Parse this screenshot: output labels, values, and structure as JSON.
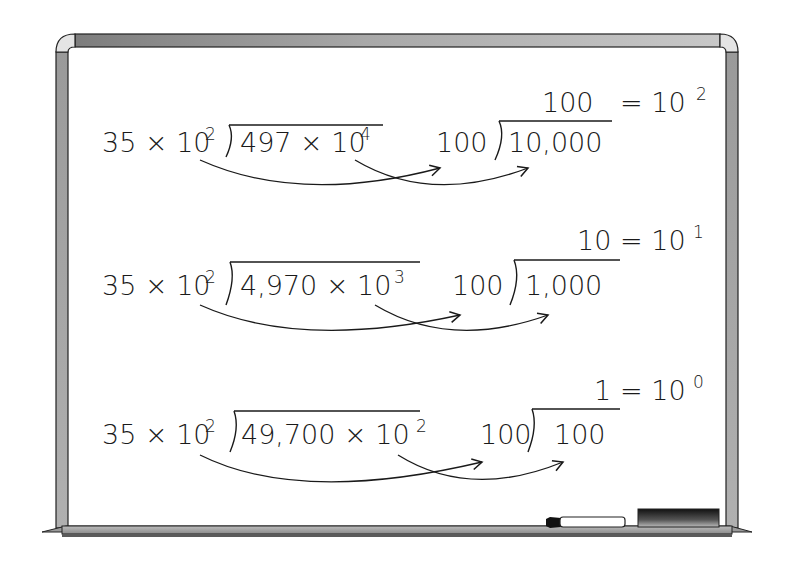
{
  "whiteboard": {
    "frame_color": "#9a9a9a",
    "frame_dark": "#3a3a3a",
    "ink_color": "#1a1a1a",
    "rows": [
      {
        "divisor": "35 × 10",
        "divisor_exp": "2",
        "dividend": "497 × 10",
        "dividend_exp": "4",
        "simplified_divisor": "100",
        "simplified_dividend": "10,000",
        "quotient": "100",
        "equals": "= 10",
        "quotient_exp": "2"
      },
      {
        "divisor": "35 × 10",
        "divisor_exp": "2",
        "dividend": "4,970 × 10",
        "dividend_exp": "3",
        "simplified_divisor": "100",
        "simplified_dividend": "1,000",
        "quotient": "10",
        "equals": "= 10",
        "quotient_exp": "1"
      },
      {
        "divisor": "35 × 10",
        "divisor_exp": "2",
        "dividend": "49,700 × 10",
        "dividend_exp": "2",
        "simplified_divisor": "100",
        "simplified_dividend": "100",
        "quotient": "1",
        "equals": "= 10",
        "quotient_exp": "0"
      }
    ],
    "tray_items": [
      "marker",
      "eraser"
    ]
  }
}
